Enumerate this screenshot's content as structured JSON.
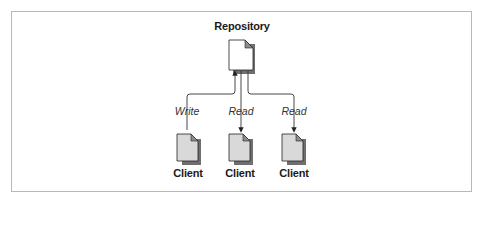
{
  "figure": {
    "nodes": {
      "repository": {
        "label": "Repository"
      },
      "clients": [
        {
          "label": "Client",
          "edge_label": "Write",
          "direction": "to-repository"
        },
        {
          "label": "Client",
          "edge_label": "Read",
          "direction": "to-client"
        },
        {
          "label": "Client",
          "edge_label": "Read",
          "direction": "to-client"
        }
      ]
    },
    "colors": {
      "border": "#b8b8b8",
      "line": "#333333",
      "repository_fill": "#ffffff",
      "client_fill": "#d9d9d9",
      "fold": "#8c8c8c",
      "shadow": "#7a7a7a"
    }
  }
}
